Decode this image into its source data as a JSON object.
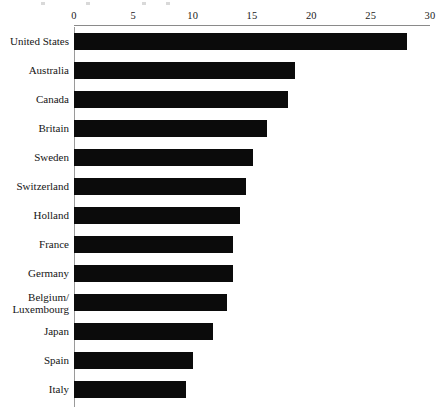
{
  "chart_data": {
    "type": "bar",
    "orientation": "horizontal",
    "title": "",
    "subtitle": "",
    "xlabel": "",
    "ylabel": "",
    "xlim": [
      0,
      30
    ],
    "xticks": [
      0,
      5,
      10,
      15,
      20,
      25,
      30
    ],
    "xtick_labels": [
      "0",
      "5",
      "10",
      "15",
      "20",
      "25",
      "30"
    ],
    "grid": false,
    "legend": false,
    "axis_position": "top",
    "bar_color": "#0b0b0b",
    "categories": [
      "United States",
      "Australia",
      "Canada",
      "Britain",
      "Sweden",
      "Switzerland",
      "Holland",
      "France",
      "Germany",
      "Belgium/\nLuxembourg",
      "Japan",
      "Spain",
      "Italy"
    ],
    "values": [
      28.1,
      18.6,
      18.0,
      16.3,
      15.1,
      14.5,
      14.0,
      13.4,
      13.4,
      12.9,
      11.7,
      10.0,
      9.4
    ]
  },
  "axis": {
    "tick_line_color": "#8a8a8a",
    "frame_color": "#9a9a9a"
  }
}
